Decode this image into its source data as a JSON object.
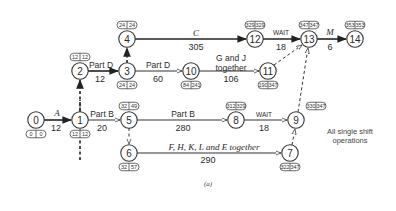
{
  "diagram": {
    "type": "activity-on-arrow network (critical path)",
    "caption": "(a)",
    "note_lines": [
      "All single shift",
      "operations"
    ],
    "nodes": [
      {
        "id": "0",
        "x": 36,
        "y": 120,
        "early": "0",
        "late": "0",
        "tag_pos": "below"
      },
      {
        "id": "1",
        "x": 80,
        "y": 120,
        "early": "12",
        "late": "12",
        "tag_pos": "below"
      },
      {
        "id": "2",
        "x": 80,
        "y": 71,
        "early": "12",
        "late": "12",
        "tag_pos": "above"
      },
      {
        "id": "3",
        "x": 127,
        "y": 71,
        "early": "24",
        "late": "24",
        "tag_pos": "below"
      },
      {
        "id": "4",
        "x": 127,
        "y": 39,
        "early": "24",
        "late": "24",
        "tag_pos": "above"
      },
      {
        "id": "5",
        "x": 129,
        "y": 120,
        "early": "32",
        "late": "49",
        "tag_pos": "above"
      },
      {
        "id": "6",
        "x": 129,
        "y": 153,
        "early": "32",
        "late": "57",
        "tag_pos": "below"
      },
      {
        "id": "7",
        "x": 290,
        "y": 153,
        "early": "322",
        "late": "347",
        "tag_pos": "below"
      },
      {
        "id": "8",
        "x": 236,
        "y": 120,
        "early": "312",
        "late": "329",
        "tag_pos": "above"
      },
      {
        "id": "9",
        "x": 296,
        "y": 120,
        "early": "330",
        "late": "347",
        "tag_pos": "aboveright"
      },
      {
        "id": "10",
        "x": 191,
        "y": 71,
        "early": "84",
        "late": "241",
        "tag_pos": "below"
      },
      {
        "id": "11",
        "x": 268,
        "y": 71,
        "early": "190",
        "late": "347",
        "tag_pos": "below"
      },
      {
        "id": "12",
        "x": 255,
        "y": 39,
        "early": "329",
        "late": "329",
        "tag_pos": "above"
      },
      {
        "id": "13",
        "x": 309,
        "y": 39,
        "early": "347",
        "late": "347",
        "tag_pos": "above"
      },
      {
        "id": "14",
        "x": 355,
        "y": 39,
        "early": "353",
        "late": "353",
        "tag_pos": "above"
      }
    ],
    "activities": [
      {
        "from": "0",
        "to": "1",
        "label": "A",
        "duration": "12",
        "critical": true,
        "dummy": false
      },
      {
        "from": "1",
        "to": "2",
        "label": "",
        "duration": "",
        "critical": true,
        "dummy": true
      },
      {
        "from": "2",
        "to": "3",
        "label": "Part D",
        "duration": "12",
        "critical": true,
        "dummy": false
      },
      {
        "from": "3",
        "to": "4",
        "label": "",
        "duration": "",
        "critical": true,
        "dummy": true
      },
      {
        "from": "4",
        "to": "12",
        "label": "C",
        "duration": "305",
        "critical": true,
        "dummy": false
      },
      {
        "from": "12",
        "to": "13",
        "label": "WAIT",
        "duration": "18",
        "critical": true,
        "dummy": false
      },
      {
        "from": "13",
        "to": "14",
        "label": "M",
        "duration": "6",
        "critical": true,
        "dummy": false
      },
      {
        "from": "3",
        "to": "10",
        "label": "Part D",
        "duration": "60",
        "critical": false,
        "dummy": false
      },
      {
        "from": "10",
        "to": "11",
        "label": "G and J together",
        "duration": "106",
        "critical": false,
        "dummy": false
      },
      {
        "from": "11",
        "to": "13",
        "label": "",
        "duration": "",
        "critical": false,
        "dummy": true
      },
      {
        "from": "1",
        "to": "5",
        "label": "Part B",
        "duration": "20",
        "critical": false,
        "dummy": false
      },
      {
        "from": "5",
        "to": "8",
        "label": "Part B",
        "duration": "280",
        "critical": false,
        "dummy": false
      },
      {
        "from": "8",
        "to": "9",
        "label": "WAIT",
        "duration": "18",
        "critical": false,
        "dummy": false
      },
      {
        "from": "9",
        "to": "13",
        "label": "",
        "duration": "",
        "critical": false,
        "dummy": true
      },
      {
        "from": "5",
        "to": "6",
        "label": "",
        "duration": "",
        "critical": false,
        "dummy": true
      },
      {
        "from": "6",
        "to": "7",
        "label": "F, H, K, L and E together",
        "duration": "290",
        "critical": false,
        "dummy": false
      },
      {
        "from": "7",
        "to": "9",
        "label": "",
        "duration": "",
        "critical": false,
        "dummy": true
      }
    ],
    "text": {
      "a_label": "A",
      "a_dur": "12",
      "pd1_label": "Part D",
      "pd1_dur": "12",
      "c_label": "C",
      "c_dur": "305",
      "wait1_label": "WAIT",
      "wait1_dur": "18",
      "m_label": "M",
      "m_dur": "6",
      "pd2_label": "Part D",
      "pd2_dur": "60",
      "gj_label1": "G and J",
      "gj_label2": "together",
      "gj_dur": "106",
      "pb1_label": "Part B",
      "pb1_dur": "20",
      "pb2_label": "Part B",
      "pb2_dur": "280",
      "wait2_label": "WAIT",
      "wait2_dur": "18",
      "fhkle_label": "F, H, K, L and E together",
      "fhkle_dur": "290"
    }
  }
}
